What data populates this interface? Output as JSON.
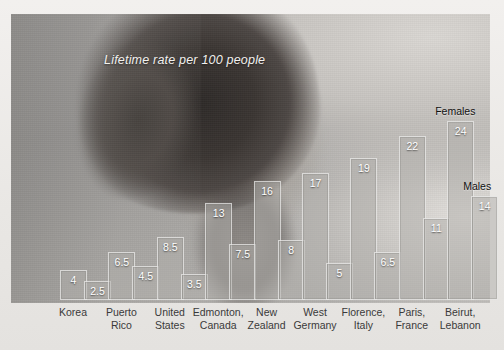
{
  "chart_data": {
    "type": "bar",
    "title": "Lifetime rate per 100 people",
    "xlabel": "",
    "ylabel": "",
    "ylim": [
      0,
      26
    ],
    "grid": false,
    "legend_position": "in-plot-annotation",
    "categories": [
      "Korea",
      "Puerto Rico",
      "United States",
      "Edmonton, Canada",
      "New Zealand",
      "West Germany",
      "Florence, Italy",
      "Paris, France",
      "Beirut, Lebanon"
    ],
    "category_lines": [
      [
        "Korea",
        ""
      ],
      [
        "Puerto",
        "Rico"
      ],
      [
        "United",
        "States"
      ],
      [
        "Edmonton,",
        "Canada"
      ],
      [
        "New",
        "Zealand"
      ],
      [
        "West",
        "Germany"
      ],
      [
        "Florence,",
        "Italy"
      ],
      [
        "Paris,",
        "France"
      ],
      [
        "Beirut,",
        "Lebanon"
      ]
    ],
    "series": [
      {
        "name": "Females",
        "values": [
          4,
          6.5,
          8.5,
          13,
          16,
          17,
          19,
          22,
          24
        ]
      },
      {
        "name": "Males",
        "values": [
          2.5,
          4.5,
          3.5,
          7.5,
          8,
          5,
          6.5,
          11,
          14
        ]
      }
    ],
    "annotations": [
      {
        "text": "Females",
        "series": "Females",
        "category": "Beirut, Lebanon"
      },
      {
        "text": "Males",
        "series": "Males",
        "category": "Beirut, Lebanon"
      }
    ],
    "value_labels": {
      "Females": [
        "4",
        "6.5",
        "8.5",
        "13",
        "16",
        "17",
        "19",
        "22",
        "24"
      ],
      "Males": [
        "2.5",
        "4.5",
        "3.5",
        "7.5",
        "8",
        "5",
        "6.5",
        "11",
        "14"
      ]
    }
  },
  "colors": {
    "bar_fill": "#b0aeaa",
    "bar_border": "#ffffff",
    "value_text": "#ffffff",
    "category_text": "#3a3a3a",
    "title_text": "#f2f1ef",
    "page_background": "#eceae7"
  },
  "image": {
    "subject": "photo-portrait-head",
    "description": "grayscale photograph of a person's head seen from behind/side"
  }
}
